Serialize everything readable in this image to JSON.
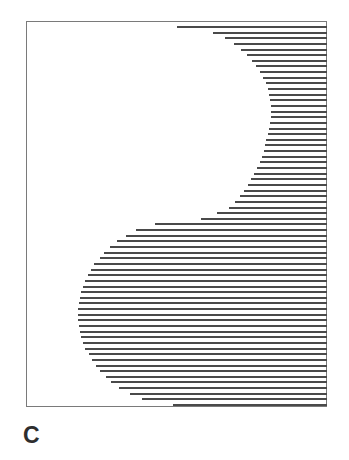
{
  "figure": {
    "panel_label": "C",
    "line_color": "#4a4a4a",
    "frame_color": "#7a7a7a",
    "frame": {
      "left": 26,
      "top": 21,
      "right": 327,
      "bottom": 407
    },
    "lines": {
      "first_y": 26,
      "spacing": 5.8,
      "right_x": 327,
      "start_x": [
        177,
        213,
        225,
        234,
        241,
        247,
        252,
        256,
        260,
        263,
        266,
        268,
        269,
        270,
        271,
        271,
        271,
        270,
        269,
        268,
        266,
        265,
        264,
        262,
        260,
        257,
        254,
        251,
        248,
        244,
        240,
        235,
        229,
        217,
        201,
        155,
        136,
        126,
        117,
        110,
        104,
        100,
        94,
        91,
        88,
        85,
        83,
        81,
        80,
        79,
        78,
        78,
        78,
        79,
        80,
        81,
        83,
        85,
        89,
        92,
        96,
        100,
        106,
        111,
        119,
        130,
        142,
        173
      ]
    }
  }
}
